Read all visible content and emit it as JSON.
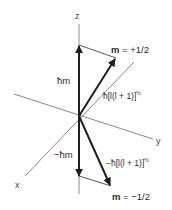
{
  "axes": {
    "z": "z",
    "y": "y",
    "x": "x"
  },
  "upper": {
    "projection_label": "ħm",
    "magnitude_label": "ħ[l(l + 1)]",
    "magnitude_exponent": "½",
    "m_symbol": "m",
    "m_value": " = +1/2"
  },
  "lower": {
    "projection_label": "−ħm",
    "magnitude_label": "−ħ[l(l + 1)]",
    "magnitude_exponent": "½",
    "m_symbol": "m",
    "m_value": " = −1/2"
  },
  "colors": {
    "axis": "#6a6a6a",
    "vector": "#1e1e1e",
    "text": "#2b2b2b"
  }
}
